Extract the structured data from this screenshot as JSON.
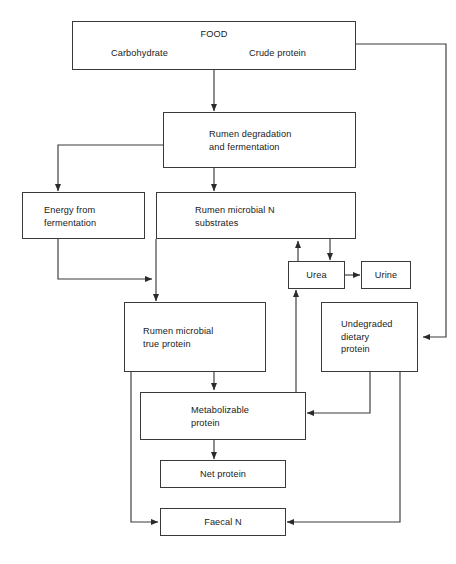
{
  "diagram": {
    "type": "flowchart",
    "nodes": [
      {
        "id": "food",
        "label": "FOOD",
        "sublabel_left": "Carbohydrate",
        "sublabel_right": "Crude protein"
      },
      {
        "id": "rumen_degradation",
        "label": "Rumen degradation\nand fermentation"
      },
      {
        "id": "energy_fermentation",
        "label": "Energy from\nfermentation"
      },
      {
        "id": "rumen_microbial_n",
        "label": "Rumen microbial N\nsubstrates"
      },
      {
        "id": "urea",
        "label": "Urea"
      },
      {
        "id": "urine",
        "label": "Urine"
      },
      {
        "id": "rumen_true_protein",
        "label": "Rumen microbial\ntrue protein"
      },
      {
        "id": "undegraded_dietary",
        "label": "Undegraded\ndietary\nprotein"
      },
      {
        "id": "metabolizable_protein",
        "label": "Metabolizable\nprotein"
      },
      {
        "id": "net_protein",
        "label": "Net protein"
      },
      {
        "id": "faecal_n",
        "label": "Faecal N"
      }
    ],
    "edges": [
      {
        "from": "food",
        "to": "rumen_degradation"
      },
      {
        "from": "food",
        "to": "undegraded_dietary"
      },
      {
        "from": "rumen_degradation",
        "to": "energy_fermentation"
      },
      {
        "from": "rumen_degradation",
        "to": "rumen_microbial_n"
      },
      {
        "from": "energy_fermentation",
        "to": "rumen_microbial_n"
      },
      {
        "from": "rumen_microbial_n",
        "to": "urea"
      },
      {
        "from": "urea",
        "to": "rumen_microbial_n"
      },
      {
        "from": "urea",
        "to": "urine"
      },
      {
        "from": "rumen_microbial_n",
        "to": "rumen_true_protein"
      },
      {
        "from": "rumen_true_protein",
        "to": "metabolizable_protein"
      },
      {
        "from": "rumen_true_protein",
        "to": "faecal_n"
      },
      {
        "from": "undegraded_dietary",
        "to": "metabolizable_protein"
      },
      {
        "from": "undegraded_dietary",
        "to": "faecal_n"
      },
      {
        "from": "metabolizable_protein",
        "to": "urea"
      },
      {
        "from": "metabolizable_protein",
        "to": "net_protein"
      }
    ],
    "colors": {
      "line": "#3a3a3a",
      "box_border": "#3a3a3a",
      "text": "#1a1a1a",
      "background": "#ffffff"
    }
  }
}
